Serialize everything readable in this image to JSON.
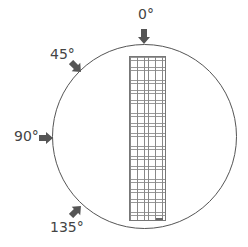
{
  "diagram": {
    "type": "angle-orientation",
    "circle": {
      "stroke_color": "#555555"
    },
    "arrow_color": "#555555",
    "angles": [
      {
        "label": "0°",
        "direction": "down"
      },
      {
        "label": "45°",
        "direction": "down-right"
      },
      {
        "label": "90°",
        "direction": "right"
      },
      {
        "label": "135°",
        "direction": "up-right"
      }
    ],
    "grid": {
      "columns": 10,
      "rows": 50,
      "line_color": "#888888"
    }
  }
}
